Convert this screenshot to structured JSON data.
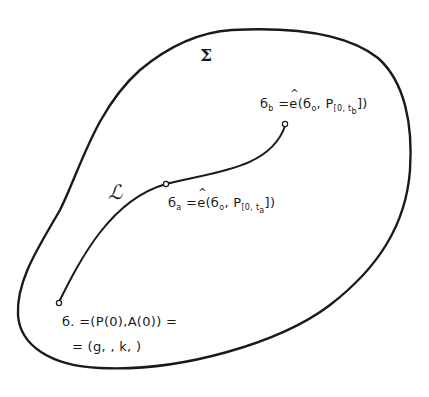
{
  "diagram": {
    "region_label": "Σ",
    "curve_label": "ℒ",
    "points": {
      "b": {
        "symbol": "б",
        "subscript": "b",
        "op": "=",
        "func": "e",
        "args_open": "(б",
        "args_sub": "o",
        "args_mid": ", P",
        "args_psub": "[0, t",
        "args_psub2": "b",
        "args_close": "])"
      },
      "a": {
        "symbol": "б",
        "subscript": "a",
        "op": "=",
        "func": "e",
        "args_open": "(б",
        "args_sub": "o",
        "args_mid": ", P",
        "args_psub": "[0, t",
        "args_psub2": "a",
        "args_close": "])"
      },
      "o": {
        "line1": "б. =(P(0),A(0)) =",
        "line2": "= (g, , k, )"
      }
    },
    "colors": {
      "stroke": "#1a1a1a",
      "background": "#ffffff"
    }
  }
}
